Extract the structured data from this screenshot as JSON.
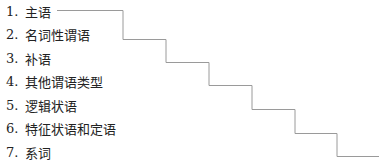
{
  "diagram": {
    "items": [
      {
        "number": "1.",
        "label": "主语"
      },
      {
        "number": "2.",
        "label": "名词性谓语"
      },
      {
        "number": "3.",
        "label": "补语"
      },
      {
        "number": "4.",
        "label": "其他谓语类型"
      },
      {
        "number": "5.",
        "label": "逻辑状语"
      },
      {
        "number": "6.",
        "label": "特征状语和定语"
      },
      {
        "number": "7.",
        "label": "系词"
      }
    ],
    "staircase_color": "#9a9a9a"
  }
}
